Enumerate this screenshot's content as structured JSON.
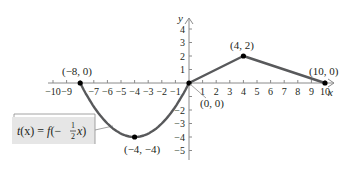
{
  "chart_data": {
    "type": "line",
    "title": "",
    "xlabel": "x",
    "ylabel": "y",
    "xlim": [
      -10,
      10
    ],
    "ylim": [
      -5,
      4
    ],
    "grid": false,
    "x_ticks": [
      -10,
      -9,
      -8,
      -7,
      -6,
      -5,
      -4,
      -3,
      -2,
      -1,
      1,
      2,
      3,
      4,
      5,
      6,
      7,
      8,
      9,
      10
    ],
    "y_ticks": [
      -5,
      -4,
      -3,
      -2,
      -1,
      1,
      2,
      3,
      4
    ],
    "x_tick_labels": [
      "−10",
      "−9",
      "",
      "−7",
      "−6",
      "−5",
      "−4",
      "−3",
      "−2",
      "−1",
      "1",
      "2",
      "3",
      "4",
      "5",
      "6",
      "7",
      "8",
      "9",
      "10"
    ],
    "y_tick_labels": [
      "−5",
      "−4",
      "−3",
      "−2",
      "",
      "1",
      "2",
      "3",
      "4"
    ],
    "series": [
      {
        "name": "t(x) = f(−½x)",
        "segments": [
          {
            "kind": "parabola",
            "from": [
              -8,
              0
            ],
            "vertex": [
              -4,
              -4
            ],
            "to": [
              0,
              0
            ]
          },
          {
            "kind": "line",
            "from": [
              0,
              0
            ],
            "to": [
              4,
              2
            ]
          },
          {
            "kind": "line",
            "from": [
              4,
              2
            ],
            "to": [
              10,
              0
            ]
          }
        ],
        "points": [
          [
            -8,
            0
          ],
          [
            -4,
            -4
          ],
          [
            0,
            0
          ],
          [
            4,
            2
          ],
          [
            10,
            0
          ]
        ]
      }
    ],
    "annotations": [
      {
        "text": "(−8, 0)",
        "at": [
          -8,
          0
        ]
      },
      {
        "text": "(−4, −4)",
        "at": [
          -4,
          -4
        ]
      },
      {
        "text": "(0, 0)",
        "at": [
          0,
          0
        ]
      },
      {
        "text": "(4, 2)",
        "at": [
          4,
          2
        ]
      },
      {
        "text": "(10, 0)",
        "at": [
          10,
          0
        ]
      }
    ],
    "legend": {
      "text": "t(x) = f(−½x)",
      "position": "lower-left box"
    },
    "colors": {
      "curve": "#58595b",
      "axes": "#8a8a8a",
      "point": "#000000",
      "label_box": "#e6e6e6"
    }
  },
  "labels": {
    "x_axis": "x",
    "y_axis": "y",
    "p1": "(−8, 0)",
    "p2": "(−4, −4)",
    "p3": "(0, 0)",
    "p4": "(4, 2)",
    "p5": "(10, 0)",
    "func_t": "t",
    "func_x1": "(x) = ",
    "func_f": "f",
    "func_open": "(− ",
    "frac_num": "1",
    "frac_den": "2",
    "func_x2": "x)"
  }
}
